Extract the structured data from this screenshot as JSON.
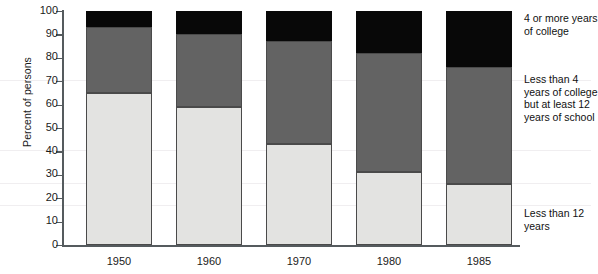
{
  "chart_data": {
    "type": "bar",
    "subtype": "stacked-bar-100-percent",
    "title": "",
    "xlabel": "",
    "ylabel": "Percent of persons",
    "ylim": [
      0,
      100
    ],
    "ytick_step": 10,
    "yticks": [
      100,
      90,
      80,
      70,
      60,
      50,
      40,
      30,
      20,
      10,
      0
    ],
    "grid": false,
    "legend_position": "right",
    "categories": [
      "1950",
      "1960",
      "1970",
      "1980",
      "1985"
    ],
    "series": [
      {
        "name": "Less than 12 years",
        "key": "low",
        "color": "#e3e3e1",
        "values": [
          65,
          59,
          43,
          31,
          26
        ]
      },
      {
        "name": "Less than 4 years of college but at least 12 years of school",
        "key": "mid",
        "color": "#636363",
        "values": [
          28,
          31,
          44,
          51,
          50
        ]
      },
      {
        "name": "4 or more years of college",
        "key": "high",
        "color": "#080808",
        "values": [
          7,
          10,
          13,
          18,
          24
        ]
      }
    ],
    "cumulative_tops": {
      "low": [
        65,
        59,
        43,
        31,
        26
      ],
      "mid": [
        93,
        90,
        87,
        82,
        76
      ],
      "high": [
        100,
        100,
        100,
        100,
        100
      ]
    }
  },
  "axis": {
    "y_title": "Percent of persons",
    "y_tick_labels": [
      "100",
      "90",
      "80",
      "70",
      "60",
      "50",
      "40",
      "30",
      "20",
      "10",
      "0"
    ],
    "x_tick_labels": [
      "1950",
      "1960",
      "1970",
      "1980",
      "1985"
    ]
  },
  "legend": {
    "high_label": "4 or more years of college",
    "mid_label": "Less than 4 years of college but at least 12 years of school",
    "low_label": "Less than 12 years"
  },
  "caption": {
    "sliver_text": ""
  }
}
